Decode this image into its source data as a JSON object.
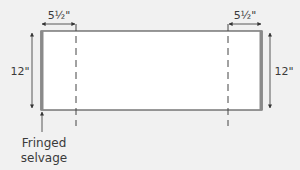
{
  "diagram": {
    "left_fold": {
      "label": "5½\""
    },
    "right_fold": {
      "label": "5½\""
    },
    "left_height": {
      "label": "12\""
    },
    "right_height": {
      "label": "12\""
    },
    "callout": {
      "line1": "Fringed",
      "line2": "selvage"
    },
    "colors": {
      "background": "#f1f1f1",
      "panel_fill": "#ffffff",
      "outline": "#555555",
      "selvage_edge": "#8a8a8a",
      "text": "#3a3a3a"
    }
  }
}
